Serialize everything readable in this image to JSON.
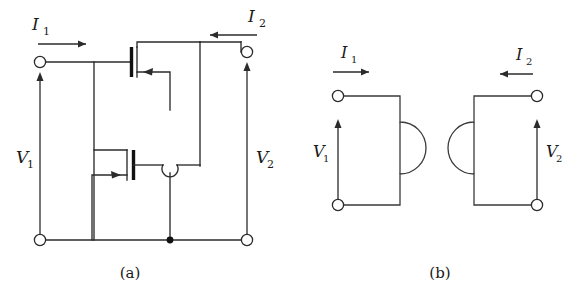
{
  "figure": {
    "background_color": "#ffffff",
    "line_color": "#2b2b2b",
    "panels": [
      {
        "id": "a",
        "caption": "(a)",
        "description": "MOSFET two-port circuit with two transistors",
        "labels": {
          "current_in": "I",
          "current_in_sub": "1",
          "current_out": "I",
          "current_out_sub": "2",
          "voltage_in": "V",
          "voltage_in_sub": "1",
          "voltage_out": "V",
          "voltage_out_sub": "2"
        }
      },
      {
        "id": "b",
        "caption": "(b)",
        "description": "Black-box two-port representation with interlocking semicircular boxes",
        "labels": {
          "current_in": "I",
          "current_in_sub": "1",
          "current_out": "I",
          "current_out_sub": "2",
          "voltage_in": "V",
          "voltage_in_sub": "1",
          "voltage_out": "V",
          "voltage_out_sub": "2"
        }
      }
    ],
    "components": {
      "mosfet_top": "mosfet-transistor",
      "mosfet_bottom": "mosfet-transistor",
      "ground_junction": "junction-dot",
      "wire_hop": "wire-crossing-hop",
      "terminals": "open-circle-terminal"
    }
  }
}
